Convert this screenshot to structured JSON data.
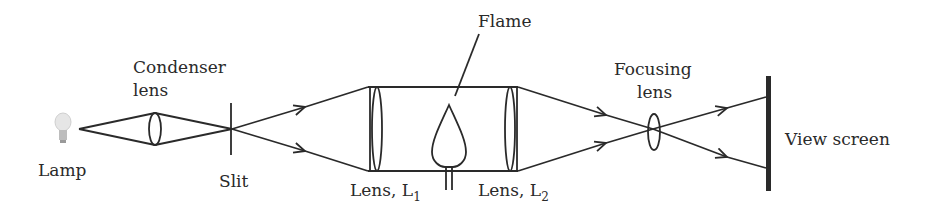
{
  "diagram": {
    "labels": {
      "lamp": "Lamp",
      "condenser_line1": "Condenser",
      "condenser_line2": "lens",
      "slit": "Slit",
      "lens1_main": "Lens, L",
      "lens1_sub": "1",
      "lens2_main": "Lens, L",
      "lens2_sub": "2",
      "flame": "Flame",
      "focusing_line1": "Focusing",
      "focusing_line2": "lens",
      "screen": "View screen"
    },
    "colors": {
      "stroke": "#2a2a2a",
      "background": "#ffffff",
      "bulb": "#cfcfcf"
    }
  }
}
